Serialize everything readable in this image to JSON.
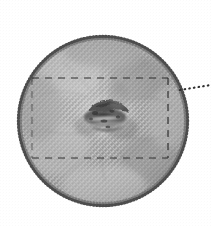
{
  "figure": {
    "title": "Before",
    "kind": "halftone-photograph-panel",
    "caption_position": "top-center"
  },
  "specimen": {
    "label": "circular-field",
    "shape": "circle",
    "center_x": 103,
    "center_y": 121,
    "radius": 86,
    "edge_style": "stippled-scalloped",
    "fill_texture": "diagonal-crosshatch-halftone",
    "fill_tone": "#9a9a9a"
  },
  "lesion": {
    "label": "central-dark-lesion",
    "center_x": 104,
    "center_y": 117,
    "width": 40,
    "height": 26,
    "tone": "#3a3a3a",
    "description": "irregular elongated dark mass"
  },
  "annotations": {
    "dashed_box": {
      "label": "region-of-interest-box",
      "left": 32,
      "top": 78,
      "right": 168,
      "bottom": 158,
      "style": "dashed",
      "color": "#2e2e2e"
    },
    "leader_line": {
      "label": "callout-leader",
      "style": "dotted",
      "x1": 180,
      "y1": 90,
      "x2": 211,
      "y2": 85,
      "color": "#2e2e2e"
    }
  },
  "colors": {
    "background": "#ffffff",
    "title_text": "#3b3b3b",
    "ink": "#2e2e2e",
    "tissue_light": "#c9c9c9",
    "tissue_mid": "#9a9a9a",
    "tissue_dark": "#5a5a5a"
  }
}
